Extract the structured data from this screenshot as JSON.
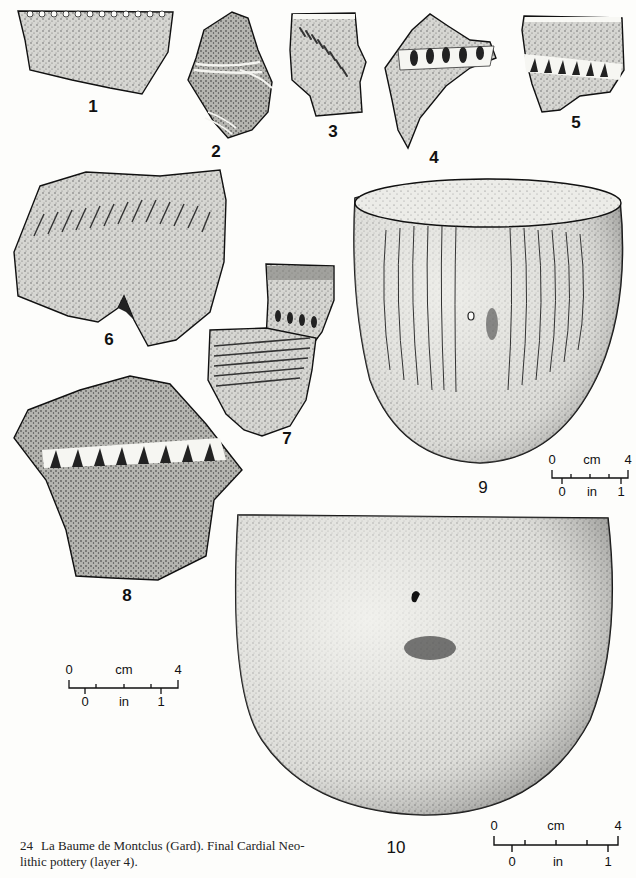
{
  "figure": {
    "number": "24",
    "caption": "La Baume de Montclus (Gard). Final Cardial Neolithic pottery (layer 4).",
    "caption_line1": "La Baume de Montclus (Gard). Final Cardial Neo-",
    "caption_line2": "lithic pottery (layer 4)."
  },
  "items": [
    {
      "label": "1",
      "type": "rim sherd",
      "decoration": "notched rim"
    },
    {
      "label": "2",
      "type": "body sherd",
      "decoration": "incised parallel lines"
    },
    {
      "label": "3",
      "type": "rim sherd",
      "decoration": "oblique impressions"
    },
    {
      "label": "4",
      "type": "sherd",
      "decoration": "applied impressed cordon"
    },
    {
      "label": "5",
      "type": "rim sherd",
      "decoration": "notched applied band"
    },
    {
      "label": "6",
      "type": "rim sherd",
      "decoration": "oblique incisions"
    },
    {
      "label": "7",
      "type": "sherds",
      "decoration": "impressed rows"
    },
    {
      "label": "8",
      "type": "sherd",
      "decoration": "notched applied cordon"
    },
    {
      "label": "9",
      "type": "complete vessel",
      "decoration": "vertical incised lines, lug"
    },
    {
      "label": "10",
      "type": "complete vessel",
      "decoration": "plain, lug"
    }
  ],
  "scales": [
    {
      "id": "scale-9",
      "cm_start": "0",
      "cm_unit": "cm",
      "cm_end": "4",
      "in_start": "0",
      "in_unit": "in",
      "in_end": "1"
    },
    {
      "id": "scale-sherds",
      "cm_start": "0",
      "cm_unit": "cm",
      "cm_end": "4",
      "in_start": "0",
      "in_unit": "in",
      "in_end": "1"
    },
    {
      "id": "scale-10",
      "cm_start": "0",
      "cm_unit": "cm",
      "cm_end": "4",
      "in_start": "0",
      "in_unit": "in",
      "in_end": "1"
    }
  ],
  "colors": {
    "paper": "#fdfdfb",
    "ink": "#111111",
    "stipple": "#8a8a8a"
  }
}
